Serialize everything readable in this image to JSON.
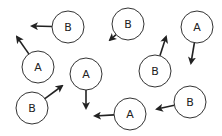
{
  "diagram": {
    "nodes": [
      {
        "id": "b1",
        "label": "B",
        "cx": 68,
        "cy": 27,
        "ax": 32,
        "ay": 26
      },
      {
        "id": "a1",
        "label": "A",
        "cx": 38,
        "cy": 67,
        "ax": 17,
        "ay": 37
      },
      {
        "id": "b2",
        "label": "B",
        "cx": 128,
        "cy": 24,
        "ax": 110,
        "ay": 40
      },
      {
        "id": "a2",
        "label": "A",
        "cx": 197,
        "cy": 27,
        "ax": 191,
        "ay": 63
      },
      {
        "id": "a3",
        "label": "A",
        "cx": 86,
        "cy": 74,
        "ax": 86,
        "ay": 108
      },
      {
        "id": "b3",
        "label": "B",
        "cx": 155,
        "cy": 71,
        "ax": 166,
        "ay": 37
      },
      {
        "id": "b4",
        "label": "B",
        "cx": 32,
        "cy": 108,
        "ax": 62,
        "ay": 86
      },
      {
        "id": "b5",
        "label": "B",
        "cx": 190,
        "cy": 102,
        "ax": 157,
        "ay": 109
      },
      {
        "id": "a4",
        "label": "A",
        "cx": 130,
        "cy": 114,
        "ax": 95,
        "ay": 116
      }
    ],
    "radius": 16,
    "stroke": "#333333"
  }
}
